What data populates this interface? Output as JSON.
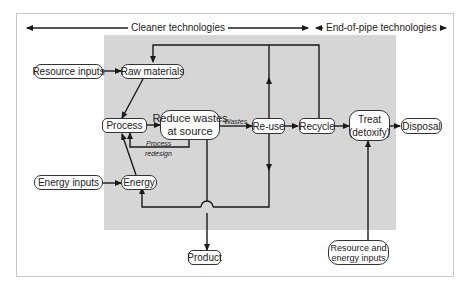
{
  "header": {
    "left_span_label": "Cleaner technologies",
    "right_span_label": "End-of-pipe technologies"
  },
  "nodes": {
    "resource_inputs": "Resource inputs",
    "raw_materials": "Raw materials",
    "process": "Process",
    "reduce_wastes_line1": "Reduce wastes",
    "reduce_wastes_line2": "at source",
    "reuse": "Re-use",
    "recycle": "Recycle",
    "treat_line1": "Treat",
    "treat_line2": "(detoxify)",
    "disposal": "Disposal",
    "energy_inputs": "Energy inputs",
    "energy": "Energy",
    "product": "Product",
    "resource_energy_line1": "Resource and",
    "resource_energy_line2": "energy inputs"
  },
  "edge_labels": {
    "wastes": "Wastes",
    "process_redesign_line1": "Process",
    "process_redesign_line2": "redesign"
  },
  "colors": {
    "line": "#1a1a1a",
    "shaded_region": "#d6d6d6",
    "frame": "#c8c8c8",
    "node_fill": "#ffffff"
  }
}
